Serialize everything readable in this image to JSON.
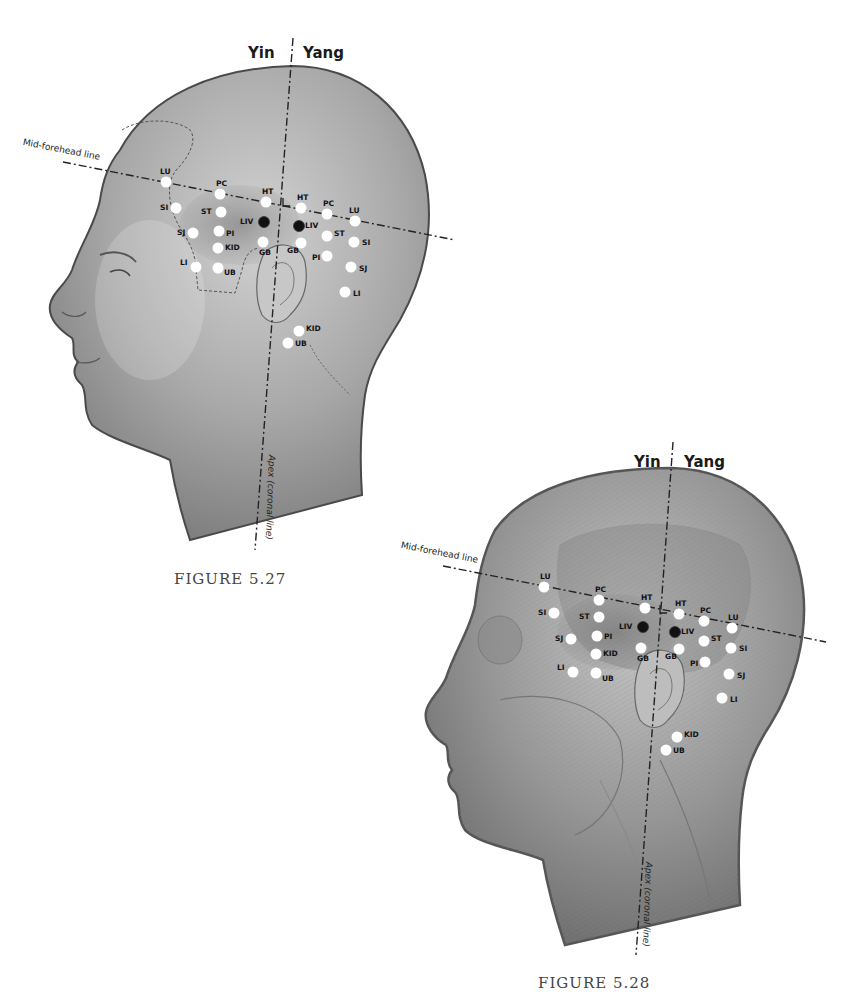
{
  "figures": [
    {
      "id": "fig1",
      "caption": "FIGURE 5.27",
      "yin_label": "Yin",
      "yang_label": "Yang",
      "midline_label": "Mid-forehead line",
      "apex_label": "Apex (coronal line)",
      "points": [
        {
          "label": "LU",
          "x": 166,
          "y": 182,
          "type": "white",
          "side": "yin",
          "lx": -6,
          "ly": -14
        },
        {
          "label": "PC",
          "x": 220,
          "y": 194,
          "type": "white",
          "side": "yin",
          "lx": -4,
          "ly": -14
        },
        {
          "label": "HT",
          "x": 266,
          "y": 202,
          "type": "white",
          "side": "yin",
          "lx": -4,
          "ly": -14
        },
        {
          "label": "SI",
          "x": 176,
          "y": 208,
          "type": "white",
          "side": "yin",
          "lx": -16,
          "ly": -4
        },
        {
          "label": "ST",
          "x": 221,
          "y": 212,
          "type": "white",
          "side": "yin",
          "lx": -20,
          "ly": -4
        },
        {
          "label": "LIV",
          "x": 264,
          "y": 222,
          "type": "black",
          "side": "yin",
          "lx": -24,
          "ly": -4
        },
        {
          "label": "SJ",
          "x": 193,
          "y": 233,
          "type": "white",
          "side": "yin",
          "lx": -16,
          "ly": -4
        },
        {
          "label": "PI",
          "x": 219,
          "y": 231,
          "type": "white",
          "side": "yin",
          "lx": 7,
          "ly": -1
        },
        {
          "label": "GB",
          "x": 263,
          "y": 242,
          "type": "white",
          "side": "yin",
          "lx": -4,
          "ly": 7
        },
        {
          "label": "KID",
          "x": 218,
          "y": 248,
          "type": "white",
          "side": "yin",
          "lx": 7,
          "ly": -4
        },
        {
          "label": "LI",
          "x": 196,
          "y": 267,
          "type": "white",
          "side": "yin",
          "lx": -16,
          "ly": -8
        },
        {
          "label": "UB",
          "x": 218,
          "y": 268,
          "type": "white",
          "side": "yin",
          "lx": 6,
          "ly": 1
        },
        {
          "label": "HT",
          "x": 301,
          "y": 208,
          "type": "white",
          "side": "yang",
          "lx": -4,
          "ly": -14
        },
        {
          "label": "LIV",
          "x": 299,
          "y": 226,
          "type": "black",
          "side": "yang",
          "lx": 6,
          "ly": -4
        },
        {
          "label": "GB",
          "x": 301,
          "y": 243,
          "type": "white",
          "side": "yang",
          "lx": -14,
          "ly": 4
        },
        {
          "label": "PC",
          "x": 327,
          "y": 214,
          "type": "white",
          "side": "yang",
          "lx": -4,
          "ly": -14
        },
        {
          "label": "ST",
          "x": 327,
          "y": 236,
          "type": "white",
          "side": "yang",
          "lx": 7,
          "ly": -6
        },
        {
          "label": "PI",
          "x": 327,
          "y": 256,
          "type": "white",
          "side": "yang",
          "lx": -15,
          "ly": -2
        },
        {
          "label": "LU",
          "x": 355,
          "y": 221,
          "type": "white",
          "side": "yang",
          "lx": -6,
          "ly": -14
        },
        {
          "label": "SI",
          "x": 354,
          "y": 242,
          "type": "white",
          "side": "yang",
          "lx": 8,
          "ly": -3
        },
        {
          "label": "SJ",
          "x": 351,
          "y": 267,
          "type": "white",
          "side": "yang",
          "lx": 8,
          "ly": -2
        },
        {
          "label": "LI",
          "x": 345,
          "y": 292,
          "type": "white",
          "side": "yang",
          "lx": 8,
          "ly": -2
        },
        {
          "label": "KID",
          "x": 299,
          "y": 331,
          "type": "white",
          "side": "yang",
          "lx": 7,
          "ly": -6
        },
        {
          "label": "UB",
          "x": 288,
          "y": 343,
          "type": "white",
          "side": "yang",
          "lx": 7,
          "ly": -3
        }
      ]
    },
    {
      "id": "fig2",
      "caption": "FIGURE 5.28",
      "yin_label": "Yin",
      "yang_label": "Yang",
      "midline_label": "Mid-forehead line",
      "apex_label": "Apex (coronal line)",
      "points": [
        {
          "label": "LU",
          "x": 544,
          "y": 587,
          "type": "white",
          "side": "yin",
          "lx": -4,
          "ly": -14
        },
        {
          "label": "PC",
          "x": 599,
          "y": 600,
          "type": "white",
          "side": "yin",
          "lx": -4,
          "ly": -14
        },
        {
          "label": "HT",
          "x": 645,
          "y": 608,
          "type": "white",
          "side": "yin",
          "lx": -4,
          "ly": -14
        },
        {
          "label": "SI",
          "x": 554,
          "y": 613,
          "type": "white",
          "side": "yin",
          "lx": -16,
          "ly": -4
        },
        {
          "label": "ST",
          "x": 599,
          "y": 617,
          "type": "white",
          "side": "yin",
          "lx": -20,
          "ly": -4
        },
        {
          "label": "LIV",
          "x": 643,
          "y": 627,
          "type": "black",
          "side": "yin",
          "lx": -24,
          "ly": -4
        },
        {
          "label": "SJ",
          "x": 571,
          "y": 639,
          "type": "white",
          "side": "yin",
          "lx": -16,
          "ly": -4
        },
        {
          "label": "PI",
          "x": 597,
          "y": 636,
          "type": "white",
          "side": "yin",
          "lx": 7,
          "ly": -3
        },
        {
          "label": "GB",
          "x": 641,
          "y": 648,
          "type": "white",
          "side": "yin",
          "lx": -4,
          "ly": 7
        },
        {
          "label": "KID",
          "x": 596,
          "y": 654,
          "type": "white",
          "side": "yin",
          "lx": 7,
          "ly": -4
        },
        {
          "label": "LI",
          "x": 573,
          "y": 672,
          "type": "white",
          "side": "yin",
          "lx": -16,
          "ly": -8
        },
        {
          "label": "UB",
          "x": 596,
          "y": 673,
          "type": "white",
          "side": "yin",
          "lx": 6,
          "ly": 2
        },
        {
          "label": "HT",
          "x": 679,
          "y": 614,
          "type": "white",
          "side": "yang",
          "lx": -4,
          "ly": -14
        },
        {
          "label": "LIV",
          "x": 675,
          "y": 632,
          "type": "black",
          "side": "yang",
          "lx": 6,
          "ly": -4
        },
        {
          "label": "GB",
          "x": 679,
          "y": 649,
          "type": "white",
          "side": "yang",
          "lx": -14,
          "ly": 4
        },
        {
          "label": "PC",
          "x": 704,
          "y": 621,
          "type": "white",
          "side": "yang",
          "lx": -4,
          "ly": -14
        },
        {
          "label": "ST",
          "x": 704,
          "y": 641,
          "type": "white",
          "side": "yang",
          "lx": 7,
          "ly": -6
        },
        {
          "label": "PI",
          "x": 705,
          "y": 662,
          "type": "white",
          "side": "yang",
          "lx": -15,
          "ly": -2
        },
        {
          "label": "LU",
          "x": 732,
          "y": 628,
          "type": "white",
          "side": "yang",
          "lx": -4,
          "ly": -14
        },
        {
          "label": "SI",
          "x": 731,
          "y": 648,
          "type": "white",
          "side": "yang",
          "lx": 8,
          "ly": -3
        },
        {
          "label": "SJ",
          "x": 729,
          "y": 674,
          "type": "white",
          "side": "yang",
          "lx": 8,
          "ly": -2
        },
        {
          "label": "LI",
          "x": 722,
          "y": 698,
          "type": "white",
          "side": "yang",
          "lx": 8,
          "ly": -2
        },
        {
          "label": "KID",
          "x": 677,
          "y": 737,
          "type": "white",
          "side": "yang",
          "lx": 7,
          "ly": -6
        },
        {
          "label": "UB",
          "x": 666,
          "y": 750,
          "type": "white",
          "side": "yang",
          "lx": 7,
          "ly": -3
        }
      ]
    }
  ],
  "colors": {
    "head_fill_1": "#b8b8b8",
    "head_fill_2": "#a9a9a9",
    "outline": "#4a4a4a",
    "point_white": "#ffffff",
    "point_black": "#111111",
    "guide_line": "#222222",
    "caption": "#444444"
  }
}
